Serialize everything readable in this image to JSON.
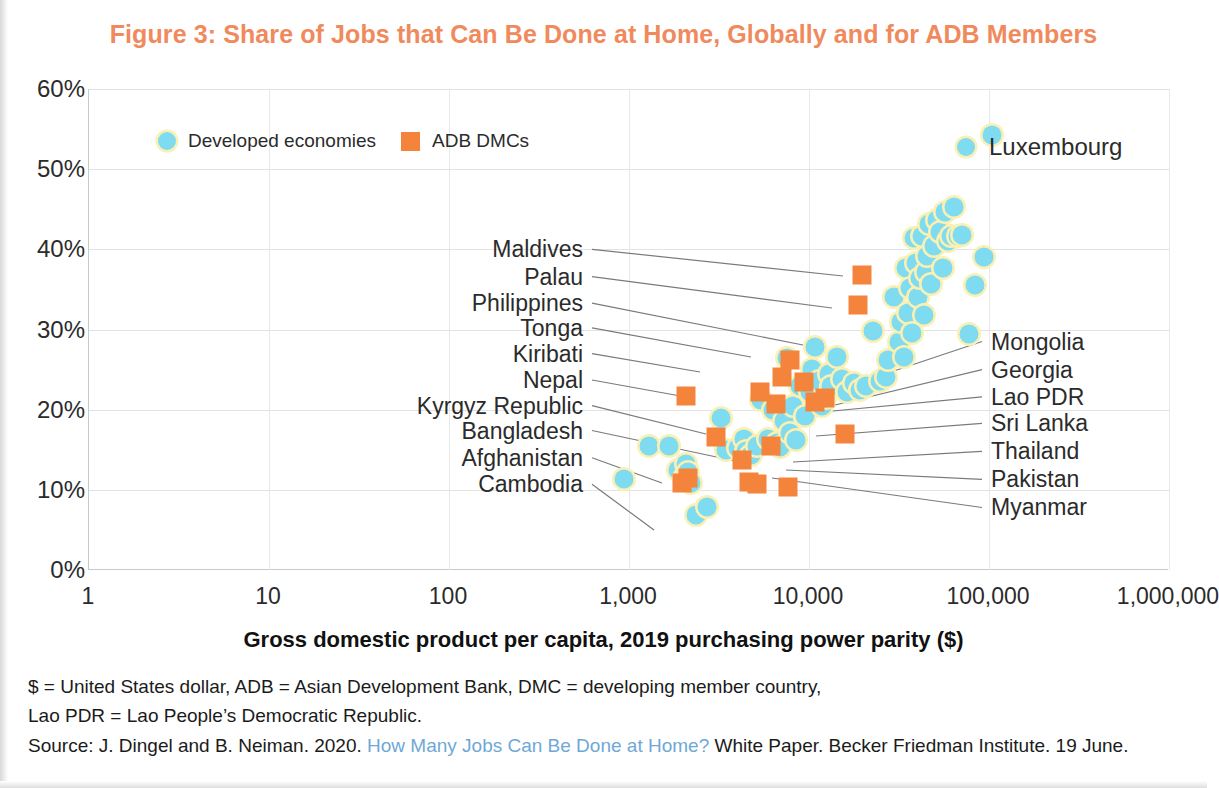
{
  "figure": {
    "title": "Figure 3: Share of Jobs that Can Be Done at Home, Globally and for ADB Members",
    "title_color": "#F08A5D"
  },
  "legend": {
    "position": "inside-top-left",
    "items": [
      {
        "label": "Developed economies",
        "marker": "circle",
        "color": "#7FDBEF"
      },
      {
        "label": "ADB DMCs",
        "marker": "square",
        "color": "#F4843C"
      }
    ]
  },
  "highlight": {
    "label": "Luxembourg",
    "marker": "circle",
    "color": "#7FDBEF"
  },
  "notes": {
    "line1": "$ = United States dollar, ADB = Asian Development Bank, DMC = developing member country,",
    "line2": "Lao PDR = Lao People’s Democratic Republic.",
    "source_prefix": "Source: J. Dingel and B. Neiman. 2020. ",
    "source_link": "How Many Jobs Can Be Done at Home?",
    "source_suffix": " White Paper. Becker Friedman Institute. 19 June.",
    "link_color": "#6FA8D6"
  },
  "chart_data": {
    "type": "scatter",
    "title": "Figure 3: Share of Jobs that Can Be Done at Home, Globally and for ADB Members",
    "xlabel": "Gross domestic product per capita, 2019 purchasing power parity ($)",
    "ylabel": "",
    "xscale": "log",
    "xlim": [
      1,
      1000000
    ],
    "ylim": [
      0,
      0.6
    ],
    "grid": true,
    "legend_position": "inside-top-left",
    "xticks": [
      1,
      10,
      100,
      1000,
      10000,
      100000,
      1000000
    ],
    "xticklabels": [
      "1",
      "10",
      "100",
      "1,000",
      "10,000",
      "100,000",
      "1,000,000"
    ],
    "yticks": [
      0,
      0.1,
      0.2,
      0.3,
      0.4,
      0.5,
      0.6
    ],
    "yticklabels": [
      "0%",
      "10%",
      "20%",
      "30%",
      "40%",
      "50%",
      "60%"
    ],
    "series": [
      {
        "name": "Developed economies",
        "marker": "circle",
        "color": "#7FDBEF",
        "points": [
          [
            950,
            0.113
          ],
          [
            1300,
            0.155
          ],
          [
            1700,
            0.155
          ],
          [
            1900,
            0.125
          ],
          [
            2050,
            0.115
          ],
          [
            2100,
            0.132
          ],
          [
            2150,
            0.122
          ],
          [
            2250,
            0.108
          ],
          [
            2400,
            0.068
          ],
          [
            2750,
            0.079
          ],
          [
            3300,
            0.19
          ],
          [
            3500,
            0.15
          ],
          [
            4100,
            0.152
          ],
          [
            4400,
            0.163
          ],
          [
            4500,
            0.148
          ],
          [
            4800,
            0.143
          ],
          [
            5200,
            0.155
          ],
          [
            5500,
            0.212
          ],
          [
            6000,
            0.163
          ],
          [
            6400,
            0.2
          ],
          [
            6700,
            0.159
          ],
          [
            7000,
            0.153
          ],
          [
            7400,
            0.186
          ],
          [
            7600,
            0.265
          ],
          [
            7900,
            0.171
          ],
          [
            8300,
            0.205
          ],
          [
            8600,
            0.162
          ],
          [
            9000,
            0.23
          ],
          [
            9600,
            0.192
          ],
          [
            10200,
            0.222
          ],
          [
            10500,
            0.251
          ],
          [
            11000,
            0.278
          ],
          [
            11500,
            0.236
          ],
          [
            12000,
            0.205
          ],
          [
            12500,
            0.214
          ],
          [
            13000,
            0.244
          ],
          [
            13500,
            0.229
          ],
          [
            14500,
            0.266
          ],
          [
            15500,
            0.238
          ],
          [
            16500,
            0.222
          ],
          [
            18000,
            0.233
          ],
          [
            19500,
            0.224
          ],
          [
            21000,
            0.229
          ],
          [
            23000,
            0.298
          ],
          [
            25000,
            0.236
          ],
          [
            27000,
            0.241
          ],
          [
            28000,
            0.262
          ],
          [
            30000,
            0.341
          ],
          [
            32000,
            0.285
          ],
          [
            33000,
            0.309
          ],
          [
            34000,
            0.266
          ],
          [
            35000,
            0.377
          ],
          [
            36000,
            0.321
          ],
          [
            37000,
            0.352
          ],
          [
            38000,
            0.296
          ],
          [
            39000,
            0.414
          ],
          [
            40000,
            0.383
          ],
          [
            41000,
            0.341
          ],
          [
            42000,
            0.364
          ],
          [
            43000,
            0.417
          ],
          [
            44000,
            0.318
          ],
          [
            45000,
            0.372
          ],
          [
            46000,
            0.392
          ],
          [
            47000,
            0.432
          ],
          [
            48000,
            0.357
          ],
          [
            50000,
            0.404
          ],
          [
            52000,
            0.437
          ],
          [
            54000,
            0.421
          ],
          [
            56000,
            0.377
          ],
          [
            58000,
            0.446
          ],
          [
            60000,
            0.411
          ],
          [
            62000,
            0.417
          ],
          [
            65000,
            0.453
          ],
          [
            68000,
            0.417
          ],
          [
            72000,
            0.418
          ],
          [
            78000,
            0.294
          ],
          [
            85000,
            0.355
          ],
          [
            95000,
            0.39
          ],
          [
            105000,
            0.542
          ]
        ]
      },
      {
        "name": "ADB DMCs",
        "marker": "square",
        "color": "#F4843C",
        "points": [
          [
            2000,
            0.108
          ],
          [
            2100,
            0.217
          ],
          [
            2150,
            0.115
          ],
          [
            3100,
            0.166
          ],
          [
            4300,
            0.137
          ],
          [
            4700,
            0.11
          ],
          [
            5200,
            0.107
          ],
          [
            5400,
            0.222
          ],
          [
            6200,
            0.155
          ],
          [
            6600,
            0.207
          ],
          [
            7200,
            0.241
          ],
          [
            7700,
            0.104
          ],
          [
            7900,
            0.262
          ],
          [
            9500,
            0.235
          ],
          [
            11000,
            0.21
          ],
          [
            12500,
            0.215
          ],
          [
            16000,
            0.17
          ],
          [
            19000,
            0.33
          ],
          [
            20000,
            0.368
          ]
        ]
      }
    ],
    "annotations_left": [
      {
        "label": "Maldives",
        "y_pct": 0.4
      },
      {
        "label": "Palau",
        "y_pct": 0.366
      },
      {
        "label": "Philippines",
        "y_pct": 0.333
      },
      {
        "label": "Tonga",
        "y_pct": 0.302
      },
      {
        "label": "Kiribati",
        "y_pct": 0.27
      },
      {
        "label": "Nepal",
        "y_pct": 0.237
      },
      {
        "label": "Kyrgyz Republic",
        "y_pct": 0.205
      },
      {
        "label": "Bangladesh",
        "y_pct": 0.174
      },
      {
        "label": "Afghanistan",
        "y_pct": 0.14
      },
      {
        "label": "Cambodia",
        "y_pct": 0.107
      }
    ],
    "annotations_right": [
      {
        "label": "Mongolia",
        "y_pct": 0.285
      },
      {
        "label": "Georgia",
        "y_pct": 0.25
      },
      {
        "label": "Lao PDR",
        "y_pct": 0.216
      },
      {
        "label": "Sri Lanka",
        "y_pct": 0.183
      },
      {
        "label": "Thailand",
        "y_pct": 0.148
      },
      {
        "label": "Pakistan",
        "y_pct": 0.113
      },
      {
        "label": "Myanmar",
        "y_pct": 0.078
      }
    ]
  }
}
